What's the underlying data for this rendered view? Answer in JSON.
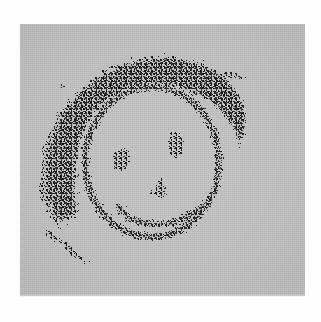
{
  "image": {
    "title": "Hand-drawn smiley face",
    "medium": "stippled / halftone scan",
    "panel": {
      "background_color": "#c3c3c3",
      "ink_color": "#171717",
      "page_color": "#fefefe",
      "x": 20,
      "y": 24,
      "width": 285,
      "height": 272
    },
    "caption": {
      "text": "",
      "visible": true,
      "legible": false
    },
    "subject": {
      "name": "smiley-face-doodle",
      "parts": [
        {
          "name": "hair",
          "description": "dense stippled mass arcing over the top and down the left side"
        },
        {
          "name": "face-outline",
          "description": "speckled oval contour"
        },
        {
          "name": "left-eye",
          "description": "small dark stipple cluster"
        },
        {
          "name": "right-eye",
          "description": "small dark stipple cluster, slightly higher"
        },
        {
          "name": "nose",
          "description": "short angled stipple mark at center"
        },
        {
          "name": "mouth",
          "description": "upward curving stippled smile"
        },
        {
          "name": "stray-speck",
          "description": "isolated dot upper-left of the hair"
        }
      ]
    },
    "geometry": {
      "face_center_x": 152,
      "face_center_y": 162,
      "face_radius_x": 67,
      "face_radius_y": 75,
      "left_eye": {
        "x": 121,
        "y": 160
      },
      "right_eye": {
        "x": 176,
        "y": 145
      },
      "nose": {
        "x": 155,
        "y": 190
      },
      "mouth_span": {
        "x1": 118,
        "x2": 202,
        "y": 214
      },
      "speck": {
        "x": 63,
        "y": 86
      }
    }
  }
}
